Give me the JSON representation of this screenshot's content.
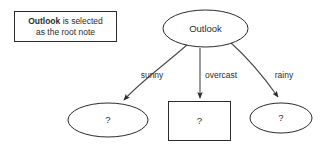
{
  "diagram": {
    "background_color": "#ffffff",
    "stroke_color": "#2b2b2b",
    "edge_color": "#4a4a4a",
    "callout": {
      "emphasis": "Outlook",
      "line1_rest": " is selected",
      "line2": "as the root note"
    },
    "root_node": {
      "label": "Outlook",
      "shape": "ellipse"
    },
    "edges": [
      {
        "label": "sunny",
        "shape": "curve-left"
      },
      {
        "label": "overcast",
        "shape": "straight"
      },
      {
        "label": "rainy",
        "shape": "curve-right"
      }
    ],
    "child_nodes": [
      {
        "label": "?",
        "shape": "ellipse",
        "branch": "sunny"
      },
      {
        "label": "?",
        "shape": "rectangle",
        "branch": "overcast"
      },
      {
        "label": "?",
        "shape": "ellipse",
        "branch": "rainy"
      }
    ]
  }
}
